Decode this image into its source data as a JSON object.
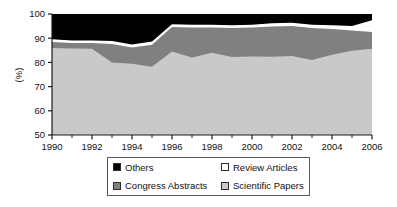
{
  "chart_data": {
    "type": "area",
    "stacked": true,
    "title": "",
    "xlabel": "",
    "ylabel": "(%)",
    "xlim": [
      1990,
      2006
    ],
    "ylim": [
      50,
      100
    ],
    "yticks": [
      50,
      60,
      70,
      80,
      90,
      100
    ],
    "xticks": [
      1990,
      1992,
      1994,
      1996,
      1998,
      2000,
      2002,
      2004,
      2006
    ],
    "xtick_labels": [
      "1990",
      "1992",
      "1994",
      "1996",
      "1998",
      "2000",
      "2002",
      "2004",
      "2006"
    ],
    "ytick_labels": [
      "50",
      "60",
      "70",
      "80",
      "90",
      "100"
    ],
    "x_minor_ticks": [
      1991,
      1993,
      1995,
      1997,
      1999,
      2001,
      2003,
      2005
    ],
    "grid": false,
    "legend_position": "below",
    "x": [
      1990,
      1991,
      1992,
      1993,
      1994,
      1995,
      1996,
      1997,
      1998,
      1999,
      2000,
      2001,
      2002,
      2003,
      2004,
      2005,
      2006
    ],
    "series": [
      {
        "name": "Scientific Papers",
        "color": "#c9c9c9",
        "cumulative_top": [
          86.0,
          85.7,
          85.6,
          80.0,
          79.4,
          78.2,
          84.5,
          82.0,
          84.0,
          82.2,
          82.4,
          82.3,
          82.6,
          81.0,
          83.2,
          84.8,
          85.6
        ],
        "values": [
          36.0,
          35.7,
          35.6,
          30.0,
          29.4,
          28.2,
          34.5,
          32.0,
          34.0,
          32.2,
          32.4,
          32.3,
          32.6,
          31.0,
          33.2,
          34.8,
          35.6
        ]
      },
      {
        "name": "Congress Abstracts",
        "color": "#808080",
        "cumulative_top": [
          88.4,
          88.0,
          88.0,
          87.6,
          86.2,
          87.3,
          94.6,
          94.4,
          94.4,
          94.2,
          94.4,
          94.8,
          95.0,
          94.2,
          93.8,
          93.2,
          92.6
        ],
        "values": [
          2.4,
          2.3,
          2.4,
          7.6,
          6.8,
          9.1,
          10.1,
          12.4,
          10.4,
          12.0,
          12.0,
          12.5,
          12.4,
          13.2,
          10.6,
          8.4,
          7.0
        ]
      },
      {
        "name": "Review Articles",
        "color": "#ffffff",
        "cumulative_top": [
          89.6,
          89.0,
          89.0,
          88.8,
          87.4,
          88.6,
          95.8,
          95.6,
          95.6,
          95.4,
          95.6,
          96.2,
          96.4,
          95.6,
          95.4,
          95.0,
          97.4
        ],
        "values": [
          1.2,
          1.0,
          1.0,
          1.2,
          1.2,
          1.3,
          1.2,
          1.2,
          1.2,
          1.2,
          1.2,
          1.4,
          1.4,
          1.4,
          1.6,
          1.8,
          4.8
        ]
      },
      {
        "name": "Others",
        "color": "#000000",
        "cumulative_top": [
          100,
          100,
          100,
          100,
          100,
          100,
          100,
          100,
          100,
          100,
          100,
          100,
          100,
          100,
          100,
          100,
          100
        ],
        "values": [
          10.4,
          11.0,
          11.0,
          11.2,
          12.6,
          11.4,
          4.2,
          4.4,
          4.4,
          4.6,
          4.4,
          3.8,
          3.6,
          4.4,
          4.6,
          5.0,
          2.6
        ]
      }
    ]
  },
  "axes": {
    "ylabel": "(%)",
    "ytick_labels": [
      "100",
      "90",
      "80",
      "70",
      "60",
      "50"
    ],
    "xtick_labels": [
      "1990",
      "1992",
      "1994",
      "1996",
      "1998",
      "2000",
      "2002",
      "2004",
      "2006"
    ]
  },
  "legend": {
    "entries": [
      {
        "label": "Others",
        "color": "#000000"
      },
      {
        "label": "Review Articles",
        "color": "#ffffff"
      },
      {
        "label": "Congress Abstracts",
        "color": "#808080"
      },
      {
        "label": "Scientific Papers",
        "color": "#c9c9c9"
      }
    ]
  }
}
